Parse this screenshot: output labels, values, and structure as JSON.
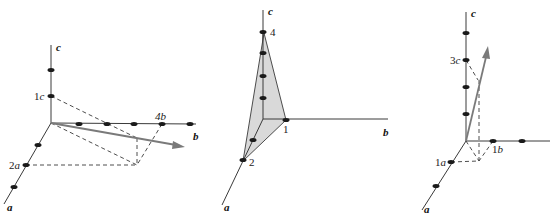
{
  "diagrams": [
    {
      "name": "direction-vector-2a-4b-1c",
      "axis_labels": {
        "a": "a",
        "b": "b",
        "c": "c"
      },
      "intercept_labels": [
        {
          "num": "1",
          "axis": "c"
        },
        {
          "num": "2",
          "axis": "a"
        },
        {
          "num": "4",
          "axis": "b"
        }
      ]
    },
    {
      "name": "plane-intercepts-2-1-4",
      "axis_labels": {
        "a": "a",
        "b": "b",
        "c": "c"
      },
      "intercept_labels": [
        {
          "num": "4",
          "axis": ""
        },
        {
          "num": "1",
          "axis": ""
        },
        {
          "num": "2",
          "axis": ""
        }
      ]
    },
    {
      "name": "direction-vector-1a-1b-3c",
      "axis_labels": {
        "a": "a",
        "b": "b",
        "c": "c"
      },
      "intercept_labels": [
        {
          "num": "3",
          "axis": "c"
        },
        {
          "num": "1",
          "axis": "a"
        },
        {
          "num": "1",
          "axis": "b"
        }
      ]
    }
  ],
  "colors": {
    "axis": "#3a3a3a",
    "vector": "#7a7a7a",
    "plane_fill": "#d9d9d9",
    "dot": "#1a1a1a"
  }
}
